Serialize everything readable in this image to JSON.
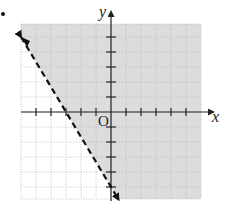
{
  "problem": {
    "marker": "•"
  },
  "chart_data": {
    "type": "line",
    "title": "",
    "xlabel": "x",
    "ylabel": "y",
    "origin_label": "O",
    "xlim": [
      -6,
      6
    ],
    "ylim": [
      -6,
      6
    ],
    "grid": true,
    "tick_spacing": 1,
    "boundary": {
      "equation": "y = -5/3 x - 5",
      "style": "dashed",
      "points": [
        [
          -6,
          5
        ],
        [
          -3,
          0
        ],
        [
          0,
          -5
        ],
        [
          0.5,
          -5.83
        ]
      ],
      "arrows": "both ends"
    },
    "inequality": "5x + 3y > -15",
    "shaded_region": "above/right of the line",
    "colors": {
      "shade": "#dcdcdc",
      "grid": "#b8b8b8",
      "axis": "#222222",
      "line": "#111111"
    }
  }
}
